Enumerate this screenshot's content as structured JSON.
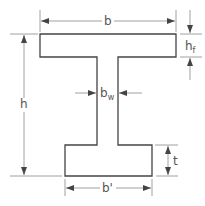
{
  "diagram": {
    "labels": {
      "b": "b",
      "h": "h",
      "hf_main": "h",
      "hf_sub": "f",
      "bw_main": "b",
      "bw_sub": "w",
      "t": "t",
      "b_prime": "b'"
    },
    "colors": {
      "stroke": "#444444",
      "dimension": "#777777"
    }
  }
}
